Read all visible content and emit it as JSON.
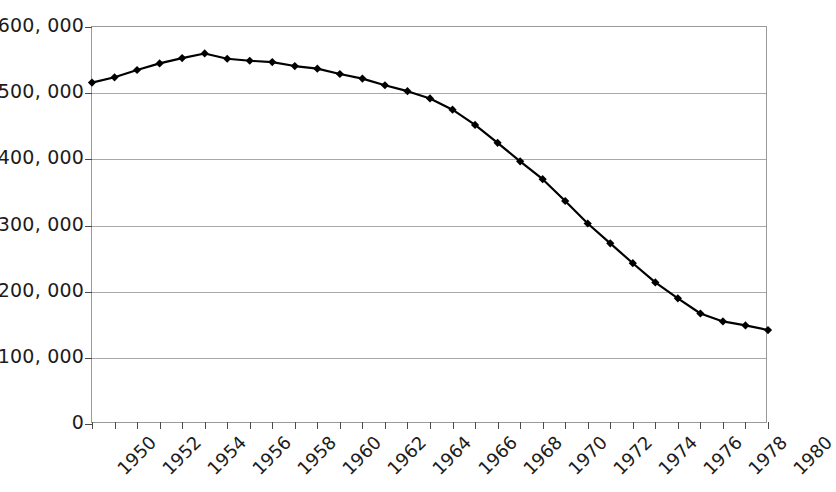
{
  "chart_data": {
    "type": "line",
    "title": "",
    "subtitle": "",
    "xlabel": "",
    "ylabel": "",
    "xlim": [
      1950,
      1980
    ],
    "ylim": [
      0,
      600000
    ],
    "grid": true,
    "legend": "none",
    "marker": "diamond",
    "line_color": "#000000",
    "marker_color": "#000000",
    "y_ticks": [
      0,
      100000,
      200000,
      300000,
      400000,
      500000,
      600000
    ],
    "y_tick_labels": [
      "0",
      "100, 000",
      "200, 000",
      "300, 000",
      "400, 000",
      "500, 000",
      "600, 000"
    ],
    "x_tick_labels": [
      "1950",
      "1952",
      "1954",
      "1956",
      "1958",
      "1960",
      "1962",
      "1964",
      "1966",
      "1968",
      "1970",
      "1972",
      "1974",
      "1976",
      "1978",
      "1980"
    ],
    "x": [
      1950,
      1951,
      1952,
      1953,
      1954,
      1955,
      1956,
      1957,
      1958,
      1959,
      1960,
      1961,
      1962,
      1963,
      1964,
      1965,
      1966,
      1967,
      1968,
      1969,
      1970,
      1971,
      1972,
      1973,
      1974,
      1975,
      1976,
      1977,
      1978,
      1979,
      1980
    ],
    "values": [
      516000,
      524000,
      535000,
      545000,
      553000,
      560000,
      552000,
      549000,
      547000,
      541000,
      537000,
      529000,
      522000,
      512000,
      503000,
      492000,
      475000,
      452000,
      425000,
      397000,
      370000,
      337000,
      303000,
      273000,
      243000,
      214000,
      190000,
      167000,
      155000,
      149000,
      142000
    ]
  }
}
